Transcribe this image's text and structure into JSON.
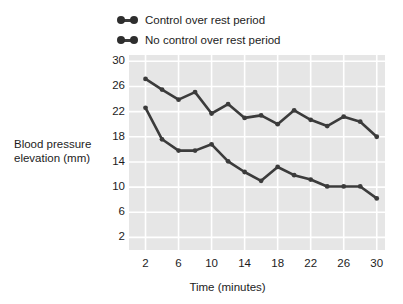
{
  "chart_data": {
    "type": "line",
    "title": "",
    "xlabel": "Time (minutes)",
    "ylabel": "Blood pressure elevation (mm)",
    "x": [
      2,
      4,
      6,
      8,
      10,
      12,
      14,
      16,
      18,
      20,
      22,
      24,
      26,
      28,
      30
    ],
    "xlim": [
      0,
      31
    ],
    "ylim": [
      0,
      31
    ],
    "xticks": [
      "2",
      "6",
      "10",
      "14",
      "18",
      "22",
      "26",
      "30"
    ],
    "xtick_values": [
      2,
      6,
      10,
      14,
      18,
      22,
      26,
      30
    ],
    "yticks": [
      "2",
      "6",
      "10",
      "14",
      "18",
      "22",
      "26",
      "30"
    ],
    "ytick_values": [
      2,
      6,
      10,
      14,
      18,
      22,
      26,
      30
    ],
    "grid": true,
    "grid_color": "#ffffff",
    "plot_background": "#e6e6e6",
    "legend_position": "above-left",
    "series": [
      {
        "name": "No control over rest period",
        "color": "#3b3b3b",
        "values": [
          27.2,
          25.5,
          23.9,
          25.1,
          21.7,
          23.2,
          21.0,
          21.4,
          20.0,
          22.2,
          20.7,
          19.7,
          21.2,
          20.4,
          18.0
        ]
      },
      {
        "name": "Control over rest period",
        "color": "#3b3b3b",
        "values": [
          22.6,
          17.6,
          15.8,
          15.8,
          16.8,
          14.1,
          12.4,
          11.0,
          13.2,
          11.9,
          11.2,
          10.1,
          10.1,
          10.1,
          8.2
        ]
      }
    ]
  },
  "legend": {
    "items": [
      {
        "label": "Control over rest period"
      },
      {
        "label": "No control over rest period"
      }
    ]
  },
  "axes": {
    "y_title_line1": "Blood pressure",
    "y_title_line2": "elevation (mm)",
    "x_title": "Time (minutes)"
  }
}
